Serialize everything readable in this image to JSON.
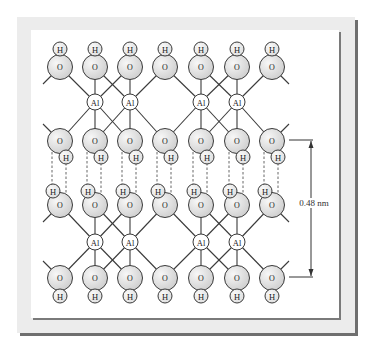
{
  "figure": {
    "dimension_label": "0.48 nm",
    "atom_labels": {
      "oxygen": "O",
      "hydrogen": "H",
      "aluminum": "Al"
    },
    "colors": {
      "frame_band": "#ececec",
      "frame_shadow": "#6f6f6f",
      "atom_fill": "#d9d9d9",
      "line": "#3a3a3a"
    }
  },
  "layout": {
    "o_x": [
      60,
      95,
      130,
      165,
      201,
      237,
      272
    ],
    "rows": {
      "top_o_y": 67,
      "top_h_y": 49,
      "mid_upper_o_y": 141,
      "mid_upper_h_dx": 6,
      "mid_upper_h_dy": 16,
      "mid_lower_o_y": 205,
      "mid_lower_h_dx": -7,
      "mid_lower_h_dy": -14,
      "bottom_o_y": 278,
      "bottom_h_y": 296
    },
    "al_upper": {
      "y": 102,
      "x": [
        95,
        130,
        201,
        237
      ]
    },
    "al_lower": {
      "y": 242,
      "x": [
        95,
        130,
        201,
        237
      ]
    },
    "dimension": {
      "x": 311,
      "y_top": 140,
      "y_bottom": 277,
      "tick_x1": 289,
      "tick_x2": 313
    }
  }
}
